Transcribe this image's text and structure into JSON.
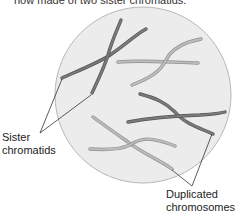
{
  "caption": "now made of two sister chromatids.",
  "labels": {
    "sister_line1": "Sister",
    "sister_line2": "chromatids",
    "dup_line1": "Duplicated",
    "dup_line2": "chromosomes"
  },
  "colors": {
    "cell_fill": "#ececec",
    "cell_stroke": "#b8b8b8",
    "dark_chromosome": "#6e6e6e",
    "light_chromosome": "#a9a9a9",
    "leader_line": "#333333"
  }
}
